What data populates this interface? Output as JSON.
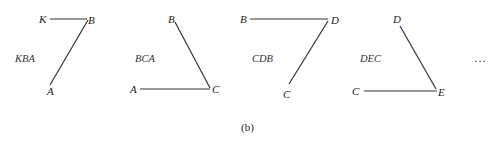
{
  "figure": {
    "caption": "(b)",
    "ellipsis": "…",
    "line_color": "#333333",
    "panels": [
      {
        "name": "KBA",
        "vertices": [
          {
            "label": "K"
          },
          {
            "label": "B"
          },
          {
            "label": "A"
          }
        ],
        "segments": [
          "KB",
          "BA"
        ]
      },
      {
        "name": "BCA",
        "vertices": [
          {
            "label": "B"
          },
          {
            "label": "A"
          },
          {
            "label": "C"
          }
        ],
        "segments": [
          "BC",
          "AC"
        ]
      },
      {
        "name": "CDB",
        "vertices": [
          {
            "label": "B"
          },
          {
            "label": "D"
          },
          {
            "label": "C"
          }
        ],
        "segments": [
          "BD",
          "DC"
        ]
      },
      {
        "name": "DEC",
        "vertices": [
          {
            "label": "D"
          },
          {
            "label": "C"
          },
          {
            "label": "E"
          }
        ],
        "segments": [
          "DE",
          "CE"
        ]
      }
    ]
  }
}
